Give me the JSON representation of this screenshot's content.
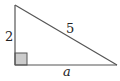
{
  "diagram": {
    "type": "right-triangle",
    "labels": {
      "vertical_leg": "2",
      "hypotenuse": "5",
      "horizontal_leg": "a"
    },
    "colors": {
      "stroke": "#555555",
      "right_angle_fill": "#cccccc"
    }
  }
}
